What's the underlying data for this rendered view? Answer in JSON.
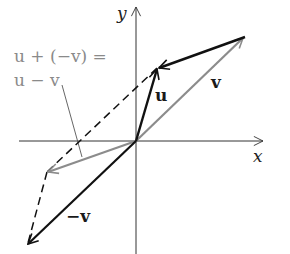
{
  "diagram": {
    "axes": {
      "x_label": "x",
      "y_label": "y"
    },
    "vectors": [
      {
        "name": "u",
        "label": "u",
        "from": [
          0,
          0
        ],
        "to": [
          0.6,
          2.1
        ],
        "color": "#000000",
        "style": "solid"
      },
      {
        "name": "v",
        "label": "v",
        "from": [
          0,
          0
        ],
        "to": [
          3.1,
          3.0
        ],
        "color": "#8c8c8c",
        "style": "solid"
      },
      {
        "name": "neg_v",
        "label": "−v",
        "from": [
          0,
          0
        ],
        "to": [
          -3.1,
          -3.0
        ],
        "color": "#000000",
        "style": "solid"
      },
      {
        "name": "u_minus_v",
        "label": "u − v",
        "from": [
          0,
          0
        ],
        "to": [
          -2.5,
          -0.9
        ],
        "color": "#8c8c8c",
        "style": "solid"
      },
      {
        "name": "v_to_u",
        "from": [
          3.1,
          3.0
        ],
        "to": [
          0.6,
          2.1
        ],
        "color": "#000000",
        "style": "solid"
      },
      {
        "name": "dashed_u_to_umv",
        "from": [
          0.6,
          2.1
        ],
        "to": [
          -2.5,
          -0.9
        ],
        "color": "#000000",
        "style": "dashed"
      },
      {
        "name": "dashed_umv_to_negv",
        "from": [
          -2.5,
          -0.9
        ],
        "to": [
          -3.1,
          -3.0
        ],
        "color": "#000000",
        "style": "dashed"
      }
    ],
    "annotation": {
      "line1": "u + (−v) =",
      "line2": "u − v"
    },
    "labels": {
      "u": "u",
      "v": "v",
      "neg_v": "−v"
    },
    "colors": {
      "black": "#111111",
      "gray": "#8c8c8c"
    }
  }
}
